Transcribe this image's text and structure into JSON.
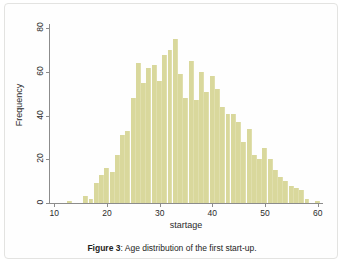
{
  "figure": {
    "caption_label": "Figure 3",
    "caption_separator": ": ",
    "caption_text": "Age distribution of the first start-up."
  },
  "colors": {
    "bar_fill": "#d9d89c",
    "axis": "#8c8c8c",
    "text": "#2b2b2b",
    "panel_border": "#e3e3e1",
    "background": "#fefefe"
  },
  "chart_data": {
    "type": "bar",
    "title": "",
    "subtitle": "",
    "xlabel": "startage",
    "ylabel": "Frequency",
    "xlim": [
      9,
      61
    ],
    "ylim": [
      0,
      82
    ],
    "xticks": [
      10,
      20,
      30,
      40,
      50,
      60
    ],
    "yticks": [
      0,
      20,
      40,
      60,
      80
    ],
    "grid": false,
    "legend": null,
    "bin_width": 1,
    "categories": [
      13,
      16,
      17,
      18,
      19,
      20,
      21,
      22,
      23,
      24,
      25,
      26,
      27,
      28,
      29,
      30,
      31,
      32,
      33,
      34,
      35,
      36,
      37,
      38,
      39,
      40,
      41,
      42,
      43,
      44,
      45,
      46,
      47,
      48,
      49,
      50,
      51,
      52,
      53,
      54,
      55,
      56,
      57,
      58,
      60
    ],
    "values": [
      1,
      3,
      2,
      9,
      13,
      16,
      14,
      22,
      31,
      33,
      48,
      64,
      55,
      62,
      63,
      56,
      68,
      70,
      75,
      59,
      48,
      65,
      47,
      60,
      51,
      58,
      52,
      44,
      41,
      41,
      37,
      28,
      34,
      22,
      20,
      25,
      20,
      15,
      12,
      10,
      8,
      7,
      6,
      2,
      1
    ],
    "annotations": []
  }
}
